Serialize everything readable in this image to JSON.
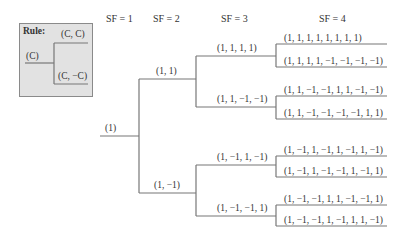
{
  "rule": {
    "title": "Rule:",
    "parent": "(C)",
    "child_top": "(C, C)",
    "child_bottom": "(C, −C)"
  },
  "headers": [
    "SF = 1",
    "SF = 2",
    "SF = 3",
    "SF = 4"
  ],
  "tree": {
    "sf1": "(1)",
    "sf2": [
      "(1, 1)",
      "(1, −1)"
    ],
    "sf3": [
      "(1, 1, 1, 1)",
      "(1, 1, −1, −1)",
      "(1, −1, 1, −1)",
      "(1, −1, −1, 1)"
    ],
    "sf4": [
      "(1,  1,  1,  1,  1,  1,  1,  1)",
      "(1, 1, 1, 1, −1, −1, −1, −1)",
      "(1, 1, −1, −1, 1, 1, −1, −1)",
      "(1, 1, −1, −1, −1, −1, 1, 1)",
      "(1, −1, 1, −1, 1, −1, 1, −1)",
      "(1, −1, 1, −1, −1, 1, −1, 1)",
      "(1, −1, −1, 1, 1, −1, −1, 1)",
      "(1, −1, −1, 1, −1, 1, 1, −1)"
    ]
  }
}
